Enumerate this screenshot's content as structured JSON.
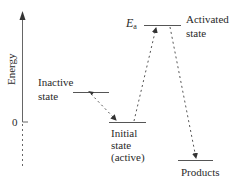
{
  "diagram": {
    "type": "energy-level-diagram",
    "axis": {
      "label": "Energy",
      "zero_label": "0"
    },
    "states": [
      {
        "id": "inactive",
        "line1": "Inactive",
        "line2": "state"
      },
      {
        "id": "initial",
        "line1": "Initial",
        "line2": "state",
        "line3": "(active)"
      },
      {
        "id": "activated",
        "line1": "Activated",
        "line2": "state"
      },
      {
        "id": "products",
        "line1": "Products"
      }
    ],
    "activation_energy": {
      "symbol": "E",
      "subscript": "a"
    },
    "transitions": [
      {
        "from": "inactive",
        "to": "initial",
        "style": "dashed-arrow"
      },
      {
        "from": "initial",
        "to": "activated",
        "style": "dashed-arrow"
      },
      {
        "from": "activated",
        "to": "products",
        "style": "dashed-arrow"
      }
    ],
    "colors": {
      "line": "#555555",
      "text": "#2a2a2a",
      "background": "#ffffff"
    }
  }
}
